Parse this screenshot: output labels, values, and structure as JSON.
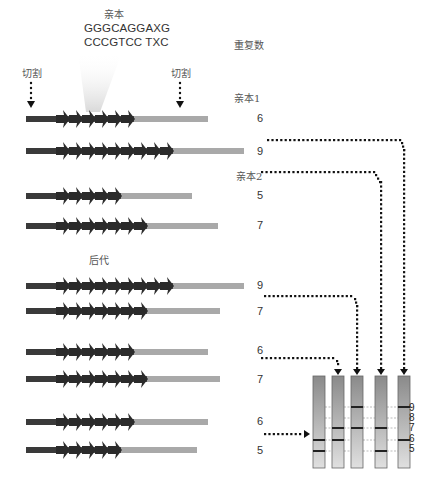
{
  "title": "亲本",
  "sequence": {
    "top": "GGGCAGGAXG",
    "bottom": "CCCGTCC TXC"
  },
  "cut_label_left": "切割",
  "cut_label_right": "切割",
  "repeat_count_header": "重复数",
  "parent1_label": "亲本1",
  "parent2_label": "亲本2",
  "offspring_label": "后代",
  "rows": [
    {
      "group": "parent1",
      "repeats": 6,
      "label": "6",
      "y": 119,
      "end": 208
    },
    {
      "group": "parent1",
      "repeats": 9,
      "label": "9",
      "y": 151,
      "end": 244
    },
    {
      "group": "parent2",
      "repeats": 5,
      "label": "5",
      "y": 196,
      "end": 192
    },
    {
      "group": "parent2",
      "repeats": 7,
      "label": "7",
      "y": 226,
      "end": 218
    },
    {
      "group": "offspring",
      "repeats": 9,
      "label": "9",
      "y": 286,
      "end": 244
    },
    {
      "group": "offspring",
      "repeats": 7,
      "label": "7",
      "y": 311,
      "end": 220
    },
    {
      "group": "offspring",
      "repeats": 6,
      "label": "6",
      "y": 352,
      "end": 208
    },
    {
      "group": "offspring",
      "repeats": 7,
      "label": "7",
      "y": 379,
      "end": 220
    },
    {
      "group": "offspring",
      "repeats": 6,
      "label": "6",
      "y": 422,
      "end": 208
    },
    {
      "group": "offspring",
      "repeats": 5,
      "label": "5",
      "y": 450,
      "end": 197
    }
  ],
  "gel": {
    "lanes": [
      {
        "bands": [
          6,
          5
        ]
      },
      {
        "bands": [
          7,
          6
        ]
      },
      {
        "bands": [
          9,
          7
        ]
      },
      {
        "bands": [
          7,
          5
        ]
      },
      {
        "bands": [
          9,
          6
        ]
      }
    ],
    "size_labels": [
      "9",
      "8",
      "7",
      "6",
      "5"
    ]
  },
  "colors": {
    "flank_dark": "#3a3a3a",
    "flank_light": "#a9a9a9",
    "repeat_arrow": "#2b2b2b",
    "dots": "#111111",
    "lane_top": "#8c8c8c",
    "lane_bottom": "#dcdcdc"
  }
}
